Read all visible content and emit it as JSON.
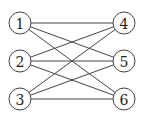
{
  "diagram": {
    "type": "bipartite-graph",
    "nodes": [
      {
        "id": "1",
        "label": "1",
        "x": 20,
        "y": 23
      },
      {
        "id": "2",
        "label": "2",
        "x": 20,
        "y": 61
      },
      {
        "id": "3",
        "label": "3",
        "x": 20,
        "y": 99
      },
      {
        "id": "4",
        "label": "4",
        "x": 124,
        "y": 23
      },
      {
        "id": "5",
        "label": "5",
        "x": 124,
        "y": 61
      },
      {
        "id": "6",
        "label": "6",
        "x": 124,
        "y": 99
      }
    ],
    "edges": [
      [
        "1",
        "4"
      ],
      [
        "1",
        "5"
      ],
      [
        "1",
        "6"
      ],
      [
        "2",
        "4"
      ],
      [
        "2",
        "5"
      ],
      [
        "2",
        "6"
      ],
      [
        "3",
        "4"
      ],
      [
        "3",
        "5"
      ],
      [
        "3",
        "6"
      ]
    ],
    "colors": {
      "stroke": "#444444",
      "fill": "#ffffff",
      "text": "#222222"
    }
  }
}
